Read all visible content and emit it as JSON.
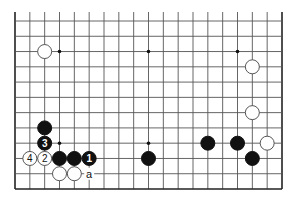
{
  "diagram": {
    "type": "go-board-partial",
    "columns": 19,
    "rows_shown": 12,
    "open_top": true,
    "colors": {
      "black": "#111111",
      "white": "#ffffff",
      "line": "#555555"
    },
    "hoshi": [
      {
        "col": 4,
        "row": 10
      },
      {
        "col": 10,
        "row": 10
      },
      {
        "col": 16,
        "row": 10
      },
      {
        "col": 4,
        "row": 4
      },
      {
        "col": 10,
        "row": 4
      },
      {
        "col": 16,
        "row": 4
      }
    ],
    "stones": [
      {
        "color": "white",
        "col": 3,
        "row": 10,
        "label": ""
      },
      {
        "color": "white",
        "col": 17,
        "row": 9,
        "label": ""
      },
      {
        "color": "white",
        "col": 17,
        "row": 6,
        "label": ""
      },
      {
        "color": "black",
        "col": 3,
        "row": 5,
        "label": ""
      },
      {
        "color": "black",
        "col": 3,
        "row": 4,
        "label": "3"
      },
      {
        "color": "white",
        "col": 2,
        "row": 3,
        "label": "4"
      },
      {
        "color": "white",
        "col": 3,
        "row": 3,
        "label": "2"
      },
      {
        "color": "black",
        "col": 4,
        "row": 3,
        "label": ""
      },
      {
        "color": "black",
        "col": 5,
        "row": 3,
        "label": ""
      },
      {
        "color": "black",
        "col": 6,
        "row": 3,
        "label": "1"
      },
      {
        "color": "black",
        "col": 10,
        "row": 3,
        "label": ""
      },
      {
        "color": "black",
        "col": 14,
        "row": 4,
        "label": ""
      },
      {
        "color": "black",
        "col": 16,
        "row": 4,
        "label": ""
      },
      {
        "color": "white",
        "col": 18,
        "row": 4,
        "label": ""
      },
      {
        "color": "black",
        "col": 17,
        "row": 3,
        "label": ""
      },
      {
        "color": "white",
        "col": 4,
        "row": 2,
        "label": ""
      },
      {
        "color": "white",
        "col": 5,
        "row": 2,
        "label": ""
      }
    ],
    "labels": [
      {
        "text": "a",
        "col": 6,
        "row": 2
      }
    ]
  }
}
